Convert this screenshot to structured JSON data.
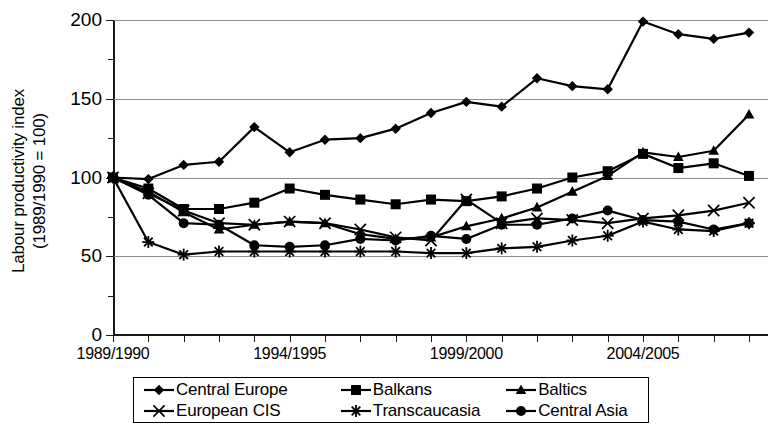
{
  "axes": {
    "ylabel_line1": "Labour productivity index",
    "ylabel_line2": "(1989/1990 = 100)",
    "yticks": [
      "0",
      "50",
      "100",
      "150",
      "200"
    ],
    "xtick_labels": [
      "1989/1990",
      "1994/1995",
      "1999/2000",
      "2004/2005"
    ]
  },
  "legend": {
    "items": [
      {
        "label": "Central Europe",
        "marker": "diamond"
      },
      {
        "label": "Balkans",
        "marker": "square"
      },
      {
        "label": "Baltics",
        "marker": "triangle"
      },
      {
        "label": "European CIS",
        "marker": "cross"
      },
      {
        "label": "Transcaucasia",
        "marker": "star"
      },
      {
        "label": "Central Asia",
        "marker": "circle"
      }
    ]
  },
  "chart_data": {
    "type": "line",
    "title": "",
    "xlabel": "",
    "ylabel": "Labour productivity index (1989/1990 = 100)",
    "ylim": [
      0,
      200
    ],
    "ytick_values": [
      0,
      50,
      100,
      150,
      200
    ],
    "yminor_step": 25,
    "grid": true,
    "legend_position": "bottom",
    "x": [
      "1989/1990",
      "1990/1991",
      "1991/1992",
      "1992/1993",
      "1993/1994",
      "1994/1995",
      "1995/1996",
      "1996/1997",
      "1997/1998",
      "1998/1999",
      "1999/2000",
      "2000/2001",
      "2001/2002",
      "2002/2003",
      "2003/2004",
      "2004/2005",
      "2005/2006",
      "2006/2007",
      "2007/2008"
    ],
    "xtick_label_indices": [
      0,
      5,
      10,
      15
    ],
    "series": [
      {
        "name": "Central Europe",
        "marker": "diamond",
        "color": "#000000",
        "values": [
          100,
          99,
          108,
          110,
          132,
          116,
          124,
          125,
          131,
          141,
          148,
          145,
          163,
          158,
          156,
          199,
          191,
          188,
          192
        ]
      },
      {
        "name": "Balkans",
        "marker": "square",
        "color": "#000000",
        "values": [
          100,
          93,
          80,
          80,
          84,
          93,
          89,
          86,
          83,
          86,
          85,
          88,
          93,
          100,
          104,
          115,
          106,
          109,
          101
        ]
      },
      {
        "name": "Baltics",
        "marker": "triangle",
        "color": "#000000",
        "values": [
          100,
          91,
          78,
          67,
          70,
          72,
          71,
          64,
          61,
          62,
          69,
          74,
          81,
          91,
          101,
          116,
          113,
          117,
          140
        ]
      },
      {
        "name": "European CIS",
        "marker": "cross",
        "color": "#000000",
        "values": [
          100,
          90,
          79,
          71,
          70,
          72,
          71,
          67,
          62,
          60,
          86,
          71,
          74,
          73,
          71,
          74,
          76,
          79,
          84
        ]
      },
      {
        "name": "Transcaucasia",
        "marker": "star",
        "color": "#000000",
        "values": [
          100,
          59,
          51,
          53,
          53,
          53,
          53,
          53,
          53,
          52,
          52,
          55,
          56,
          60,
          63,
          72,
          67,
          66,
          71
        ]
      },
      {
        "name": "Central Asia",
        "marker": "circle",
        "color": "#000000",
        "values": [
          100,
          89,
          71,
          70,
          57,
          56,
          57,
          61,
          60,
          63,
          61,
          70,
          70,
          74,
          79,
          73,
          72,
          67,
          71
        ]
      }
    ]
  }
}
